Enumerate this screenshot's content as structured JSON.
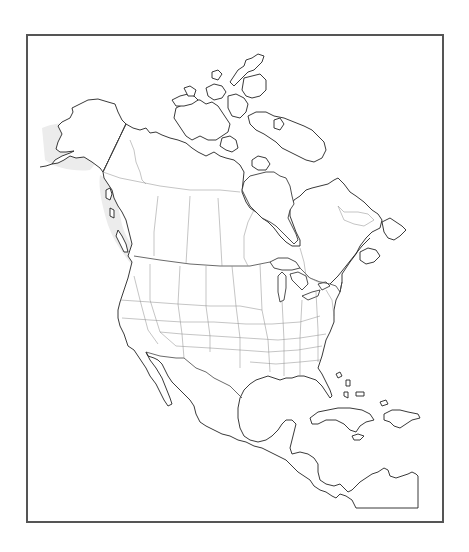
{
  "map": {
    "title": "",
    "type": "blank outline map",
    "region": "North America",
    "frame": {
      "x": 26,
      "y": 34,
      "width": 418,
      "height": 489,
      "border_color": "#555555"
    },
    "colors": {
      "background": "#ffffff",
      "coastline": "#222222",
      "international_border": "#444444",
      "state_border": "#8a8a8a",
      "shaded_relief": "#ececec"
    },
    "features": [
      {
        "name": "Alaska",
        "kind": "land"
      },
      {
        "name": "Canada",
        "kind": "land"
      },
      {
        "name": "Canadian Arctic Archipelago",
        "kind": "islands"
      },
      {
        "name": "Greenland (partial)",
        "kind": "land"
      },
      {
        "name": "Hudson Bay",
        "kind": "water"
      },
      {
        "name": "James Bay",
        "kind": "water"
      },
      {
        "name": "Great Lakes",
        "kind": "water"
      },
      {
        "name": "Contiguous United States",
        "kind": "land"
      },
      {
        "name": "Mexico",
        "kind": "land"
      },
      {
        "name": "Baja California",
        "kind": "land"
      },
      {
        "name": "Gulf of Mexico",
        "kind": "water"
      },
      {
        "name": "Florida",
        "kind": "land"
      },
      {
        "name": "Central America",
        "kind": "land"
      },
      {
        "name": "Cuba",
        "kind": "island"
      },
      {
        "name": "Hispaniola",
        "kind": "island"
      },
      {
        "name": "Jamaica",
        "kind": "island"
      },
      {
        "name": "Bahamas",
        "kind": "islands"
      },
      {
        "name": "Puerto Rico",
        "kind": "island"
      },
      {
        "name": "Newfoundland",
        "kind": "island"
      }
    ],
    "labels": []
  }
}
